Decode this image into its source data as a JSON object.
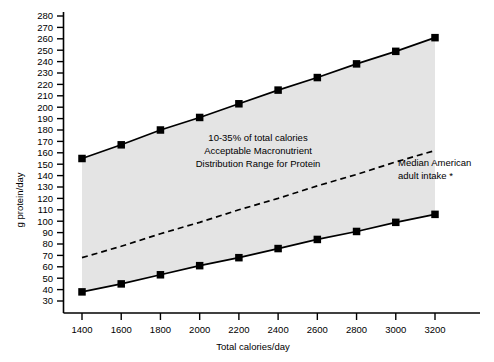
{
  "chart_data": {
    "type": "line",
    "title": "",
    "xlabel": "Total calories/day",
    "ylabel": "g protein/day",
    "x": [
      1400,
      1600,
      1800,
      2000,
      2200,
      2400,
      2600,
      2800,
      3000,
      3200
    ],
    "xlim": [
      1300,
      3300
    ],
    "ylim": [
      25,
      285
    ],
    "ytick_labels": [
      "280",
      "270",
      "260",
      "250",
      "240",
      "230",
      "220",
      "210",
      "200",
      "190",
      "180",
      "170",
      "160",
      "150",
      "140",
      "130",
      "120",
      "110",
      "100",
      "90",
      "80",
      "70",
      "60",
      "50",
      "40",
      "30"
    ],
    "ytick_values": [
      280,
      270,
      260,
      250,
      240,
      230,
      220,
      210,
      200,
      190,
      180,
      170,
      160,
      150,
      140,
      130,
      120,
      110,
      100,
      90,
      80,
      70,
      60,
      50,
      40,
      30
    ],
    "xtick_labels": [
      "1400",
      "1600",
      "1800",
      "2000",
      "2200",
      "2400",
      "2600",
      "2800",
      "3000",
      "3200"
    ],
    "grid": false,
    "legend": "none",
    "series": [
      {
        "name": "Upper bound (35% of total calories)",
        "style": "solid-line-with-square-markers",
        "color": "#000000",
        "marker": "square",
        "values": [
          155,
          167,
          180,
          191,
          203,
          215,
          226,
          238,
          249,
          261
        ]
      },
      {
        "name": "Lower bound (10% of total calories)",
        "style": "solid-line-with-square-markers",
        "color": "#000000",
        "marker": "square",
        "values": [
          38,
          45,
          53,
          61,
          68,
          76,
          84,
          91,
          99,
          106
        ]
      },
      {
        "name": "Median American adult intake",
        "style": "dashed-line",
        "color": "#000000",
        "marker": "none",
        "values": [
          68,
          78,
          89,
          99,
          110,
          120,
          131,
          141,
          152,
          162
        ]
      }
    ],
    "shaded_band": {
      "label": "Acceptable Macronutrient Distribution Range",
      "color": "#e3e3e3",
      "between": [
        "Lower bound (10% of total calories)",
        "Upper bound (35% of total calories)"
      ]
    },
    "annotations": [
      {
        "id": "amdr-label",
        "lines": [
          "10-35% of total calories",
          "Acceptable Macronutrient",
          "Distribution Range for Protein"
        ]
      },
      {
        "id": "median-label",
        "lines": [
          "Median American",
          "adult intake *"
        ]
      }
    ]
  },
  "axes": {
    "y_title": "g protein/day",
    "x_title": "Total calories/day"
  }
}
